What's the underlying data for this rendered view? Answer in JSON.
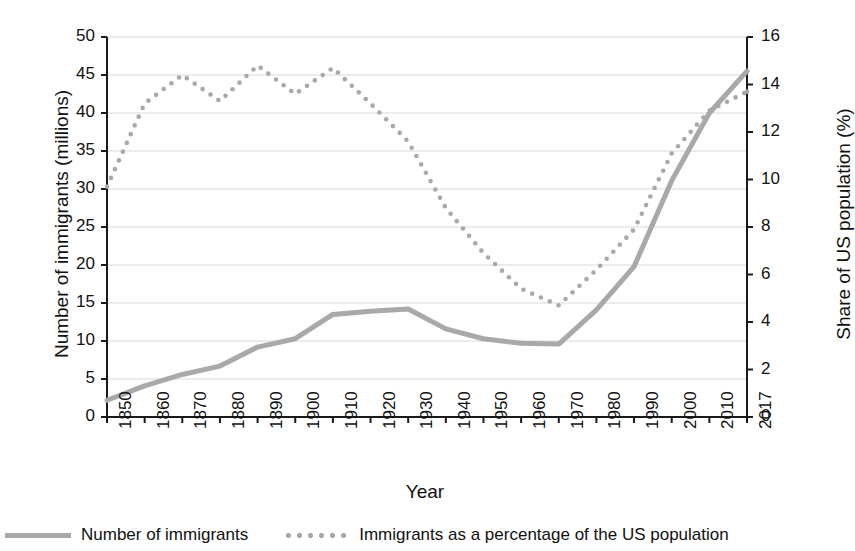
{
  "chart_data": {
    "type": "line",
    "title": "",
    "xlabel": "Year",
    "ylabel": "Number of immigrants (millions)",
    "ylabel_right": "Share of US population (%)",
    "grid": true,
    "legend_position": "bottom",
    "x": [
      1850,
      1860,
      1870,
      1880,
      1890,
      1900,
      1910,
      1920,
      1930,
      1940,
      1950,
      1960,
      1970,
      1980,
      1990,
      2000,
      2010,
      2017
    ],
    "categories": [
      "1850",
      "1860",
      "1870",
      "1880",
      "1890",
      "1900",
      "1910",
      "1920",
      "1930",
      "1940",
      "1950",
      "1960",
      "1970",
      "1980",
      "1990",
      "2000",
      "2010",
      "2017"
    ],
    "ylim": [
      0,
      50
    ],
    "yticks": [
      0,
      5,
      10,
      15,
      20,
      25,
      30,
      35,
      40,
      45,
      50
    ],
    "ylim_right": [
      0,
      16
    ],
    "yticks_right": [
      0,
      2,
      4,
      6,
      8,
      10,
      12,
      14,
      16
    ],
    "series": [
      {
        "name": "Number of immigrants",
        "axis": "left",
        "style": "solid",
        "color": "#a9a9a9",
        "values": [
          2.2,
          4.1,
          5.6,
          6.7,
          9.2,
          10.3,
          13.5,
          13.9,
          14.2,
          11.6,
          10.3,
          9.7,
          9.6,
          14.1,
          19.8,
          31.1,
          40.0,
          45.5
        ]
      },
      {
        "name": "Immigrants as a percentage of the US population",
        "axis": "right",
        "style": "dotted",
        "color": "#a9a9a9",
        "values": [
          9.7,
          13.2,
          14.4,
          13.3,
          14.8,
          13.6,
          14.7,
          13.2,
          11.6,
          8.8,
          6.9,
          5.4,
          4.7,
          6.2,
          7.9,
          11.1,
          12.9,
          13.7
        ]
      }
    ]
  },
  "legend": {
    "items": [
      {
        "label": "Number of immigrants",
        "style": "solid"
      },
      {
        "label": "Immigrants as a percentage of the US population",
        "style": "dotted"
      }
    ]
  },
  "colors": {
    "line": "#a9a9a9",
    "grid": "#d9d9d9",
    "axis": "#1a1a1a",
    "text": "#111111",
    "background": "#ffffff"
  }
}
